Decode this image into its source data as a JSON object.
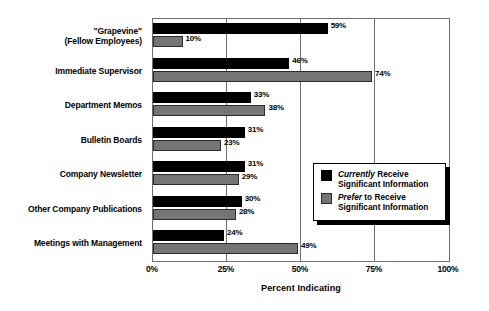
{
  "chart_data": {
    "type": "bar",
    "orientation": "horizontal",
    "title": "",
    "xlabel": "Percent Indicating",
    "ylabel": "",
    "xlim": [
      0,
      100
    ],
    "xticks": [
      "0%",
      "25%",
      "50%",
      "75%",
      "100%"
    ],
    "xtick_values": [
      0,
      25,
      50,
      75,
      100
    ],
    "grid": true,
    "legend_position": "lower-right-inside",
    "categories": [
      "\"Grapevine\"\n(Fellow Employees)",
      "Immediate Supervisor",
      "Department Memos",
      "Bulletin Boards",
      "Company Newsletter",
      "Other Company Publications",
      "Meetings with Management"
    ],
    "category_lines": [
      [
        "\"Grapevine\"",
        "(Fellow Employees)"
      ],
      [
        "Immediate Supervisor"
      ],
      [
        "Department Memos"
      ],
      [
        "Bulletin Boards"
      ],
      [
        "Company Newsletter"
      ],
      [
        "Other Company Publications"
      ],
      [
        "Meetings with Management"
      ]
    ],
    "series": [
      {
        "name": "Currently Receive Significant Information",
        "color": "#000000",
        "values": [
          59,
          46,
          33,
          31,
          31,
          30,
          24
        ],
        "labels": [
          "59%",
          "46%",
          "33%",
          "31%",
          "31%",
          "30%",
          "24%"
        ]
      },
      {
        "name": "Prefer to Receive Significant Information",
        "color": "#757575",
        "values": [
          10,
          74,
          38,
          23,
          29,
          28,
          49
        ],
        "labels": [
          "10%",
          "74%",
          "38%",
          "23%",
          "29%",
          "28%",
          "49%"
        ]
      }
    ]
  },
  "legend": {
    "items": [
      {
        "emphasis": "Currently",
        "rest": " Receive",
        "line2": "Significant Information",
        "swatch": "black"
      },
      {
        "emphasis": "Prefer",
        "rest": " to Receive",
        "line2": "Significant Information",
        "swatch": "gray"
      }
    ]
  },
  "colors": {
    "currently": "#000000",
    "prefer": "#757575",
    "frame": "#6f6f6f",
    "background": "#ffffff"
  }
}
